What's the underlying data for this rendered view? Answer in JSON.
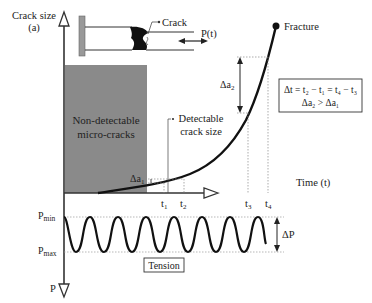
{
  "axes": {
    "y_label_line1": "Crack size",
    "y_label_line2": "(a)",
    "x_label": "Time (t)",
    "p_axis_label": "P"
  },
  "specimen": {
    "crack_label": "Crack",
    "load_label": "P(t)"
  },
  "regions": {
    "non_detectable_line1": "Non-detectable",
    "non_detectable_line2": "micro-cracks",
    "color": "#8a8a8a"
  },
  "annotations": {
    "fracture": "Fracture",
    "detectable_line1": "Detectable",
    "detectable_line2": "crack size",
    "delta_a1": "Δa",
    "delta_a1_sub": "1",
    "delta_a2": "Δa",
    "delta_a2_sub": "2",
    "box_line1": "Δt = t₂ − t₁ = t₄ − t₃",
    "box_line2": "Δa₂ > Δa₁"
  },
  "time_ticks": [
    {
      "label": "t",
      "sub": "1"
    },
    {
      "label": "t",
      "sub": "2"
    },
    {
      "label": "t",
      "sub": "3"
    },
    {
      "label": "t",
      "sub": "4"
    }
  ],
  "loading": {
    "p_min": "P",
    "p_min_sub": "min",
    "p_max": "P",
    "p_max_sub": "max",
    "delta_p": "ΔP",
    "tension": "Tension",
    "cycles": 6
  }
}
